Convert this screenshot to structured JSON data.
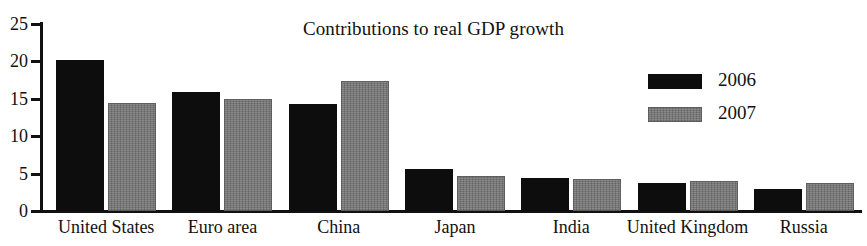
{
  "figure": {
    "clipped_text_above": "",
    "background_color": "#ffffff"
  },
  "chart_data": {
    "type": "bar",
    "title": "Contributions to real GDP growth",
    "xlabel": "",
    "ylabel": "",
    "ylim": [
      0,
      25
    ],
    "yticks": [
      0,
      5,
      10,
      15,
      20,
      25
    ],
    "ytick_labels": [
      "0",
      "5",
      "10",
      "15",
      "20",
      "25"
    ],
    "grid": false,
    "legend_position": "upper right",
    "categories": [
      "United States",
      "Euro area",
      "China",
      "Japan",
      "India",
      "United Kingdom",
      "Russia"
    ],
    "series": [
      {
        "name": "2006",
        "color": "#0d0d0d",
        "values": [
          20.2,
          15.9,
          14.3,
          5.6,
          4.4,
          3.7,
          2.9
        ]
      },
      {
        "name": "2007",
        "color": "#777777",
        "values": [
          14.4,
          15.0,
          17.4,
          4.7,
          4.3,
          4.0,
          3.8
        ]
      }
    ]
  }
}
